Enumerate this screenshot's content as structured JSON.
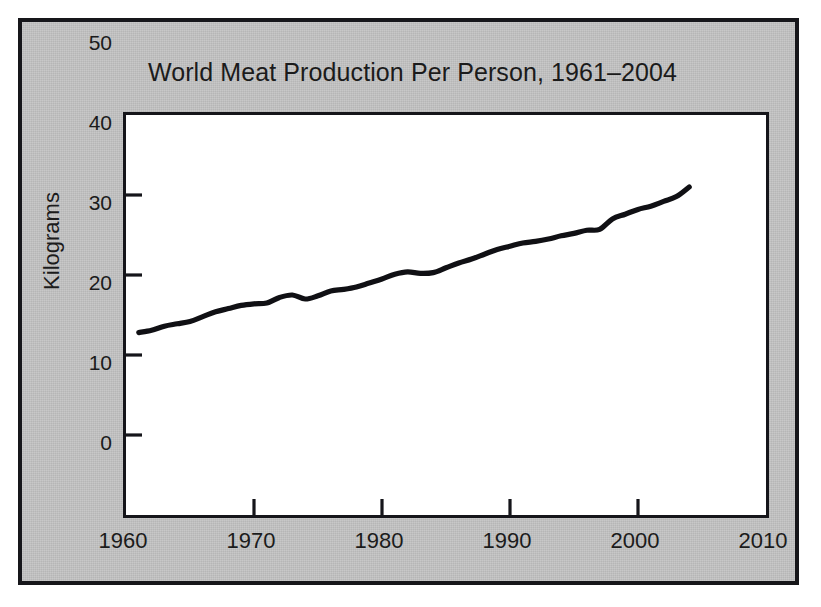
{
  "figure": {
    "background_color": "#c3c3c3",
    "border_color": "#16161a",
    "plot_background": "#ffffff",
    "line_color": "#101014"
  },
  "chart_data": {
    "type": "line",
    "title": "World Meat Production Per Person, 1961–2004",
    "xlabel": "",
    "ylabel": "Kilograms",
    "xlim": [
      1960,
      2010
    ],
    "ylim": [
      0,
      50
    ],
    "xticks": [
      1960,
      1970,
      1980,
      1990,
      2000,
      2010
    ],
    "yticks": [
      0,
      10,
      20,
      30,
      40,
      50
    ],
    "xtick_labels": [
      "1960",
      "1970",
      "1980",
      "1990",
      "2000",
      "2010"
    ],
    "ytick_labels": [
      "0",
      "10",
      "20",
      "30",
      "40",
      "50"
    ],
    "grid": false,
    "legend": false,
    "series": [
      {
        "name": "World meat production per person",
        "units": "kilograms",
        "x": [
          1961,
          1962,
          1963,
          1964,
          1965,
          1966,
          1967,
          1968,
          1969,
          1970,
          1971,
          1972,
          1973,
          1974,
          1975,
          1976,
          1977,
          1978,
          1979,
          1980,
          1981,
          1982,
          1983,
          1984,
          1985,
          1986,
          1987,
          1988,
          1989,
          1990,
          1991,
          1992,
          1993,
          1994,
          1995,
          1996,
          1997,
          1998,
          1999,
          2000,
          2001,
          2002,
          2003,
          2004
        ],
        "values": [
          22.8,
          23.1,
          23.6,
          23.9,
          24.2,
          24.8,
          25.4,
          25.8,
          26.2,
          26.4,
          26.5,
          27.2,
          27.5,
          27.0,
          27.4,
          28.0,
          28.2,
          28.5,
          29.0,
          29.5,
          30.1,
          30.4,
          30.2,
          30.3,
          30.9,
          31.5,
          32.0,
          32.6,
          33.2,
          33.6,
          34.0,
          34.2,
          34.5,
          34.9,
          35.2,
          35.6,
          35.7,
          37.0,
          37.6,
          38.2,
          38.6,
          39.2,
          39.8,
          41.0
        ]
      }
    ]
  }
}
